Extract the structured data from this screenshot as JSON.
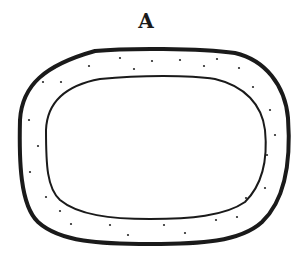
{
  "figure": {
    "label": "A",
    "colors": {
      "stroke": "#1a1a1a",
      "background": "#ffffff",
      "dot": "#2a2a2a"
    },
    "outer_shape": {
      "description": "thick rounded outer boundary",
      "stroke_width": 4
    },
    "inner_shape": {
      "description": "thin rounded inner boundary",
      "stroke_width": 2
    },
    "dots": [
      [
        43,
        82
      ],
      [
        61,
        82
      ],
      [
        89,
        66
      ],
      [
        120,
        58
      ],
      [
        134,
        69
      ],
      [
        152,
        61
      ],
      [
        180,
        60
      ],
      [
        204,
        66
      ],
      [
        217,
        59
      ],
      [
        239,
        68
      ],
      [
        253,
        87
      ],
      [
        270,
        110
      ],
      [
        29,
        120
      ],
      [
        38,
        146
      ],
      [
        30,
        172
      ],
      [
        46,
        197
      ],
      [
        60,
        211
      ],
      [
        71,
        224
      ],
      [
        110,
        225
      ],
      [
        128,
        235
      ],
      [
        164,
        225
      ],
      [
        185,
        233
      ],
      [
        216,
        220
      ],
      [
        237,
        217
      ],
      [
        246,
        198
      ],
      [
        265,
        188
      ],
      [
        267,
        155
      ],
      [
        275,
        135
      ]
    ]
  }
}
